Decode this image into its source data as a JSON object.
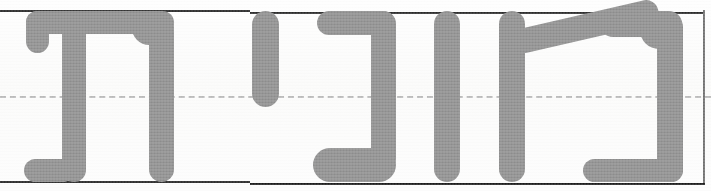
{
  "document": {
    "type": "handwriting-practice-worksheet",
    "script": "Hebrew",
    "direction": "rtl",
    "word_text": "תינוה",
    "word_reading_rtl": "הונית",
    "caption": "תינוה"
  },
  "ink": {
    "color": "#8c8c8c",
    "stroke_width_px": 22,
    "style": "rounded-terminal"
  },
  "guides": {
    "top_line_label": "top-rule",
    "mid_line_label": "mid-dashed-rule",
    "bottom_line_label": "bottom-rule",
    "right_margin_label": "right-margin-rule",
    "top_line_color": "#1b1b1b",
    "mid_line_color": "#b9b9b9",
    "bottom_line_color": "#1b1b1b",
    "right_margin_color": "#6f6f6f",
    "top_line_y": 10,
    "mid_line_y": 96,
    "bottom_line_y": 181,
    "right_margin_x": 703,
    "mid_line_style": "dashed"
  },
  "letters": [
    {
      "index": 0,
      "name": "tav",
      "char": "ת",
      "position": "leftmost",
      "x": 24,
      "width": 150
    },
    {
      "index": 1,
      "name": "yod",
      "char": "י",
      "position": "second-from-left",
      "x": 250,
      "width": 30
    },
    {
      "index": 2,
      "name": "nun",
      "char": "נ",
      "position": "middle",
      "x": 315,
      "width": 100
    },
    {
      "index": 3,
      "name": "vav",
      "char": "ו",
      "position": "fourth-from-left",
      "x": 432,
      "width": 28
    },
    {
      "index": 4,
      "name": "he",
      "char": "ה",
      "position": "rightmost",
      "x": 497,
      "width": 185
    }
  ],
  "canvas": {
    "width": 711,
    "height": 191,
    "background_color": "#fdfdfc"
  }
}
